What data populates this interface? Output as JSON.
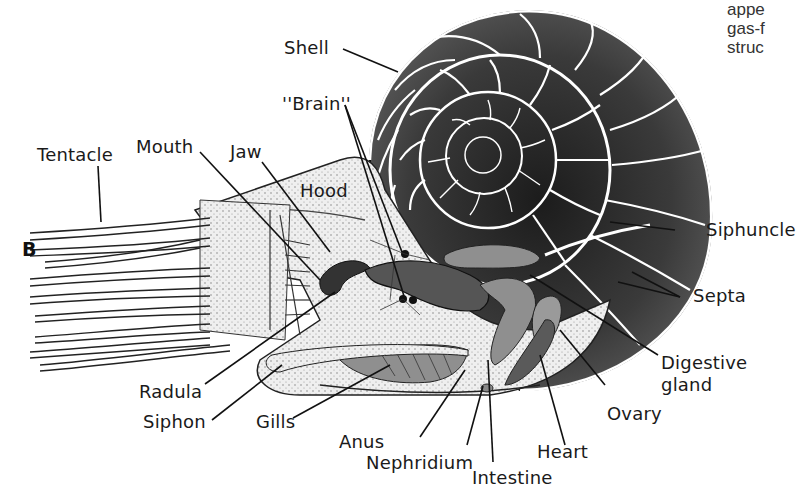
{
  "figure": {
    "panel_letter": "B",
    "caption_fragment": [
      "appe",
      "gas-f",
      "struc"
    ],
    "colors": {
      "ink": "#1a1a1a",
      "shell_fill": "#3a3a3a",
      "organ_fill": "#8f8f8f",
      "body_fill": "#e6e6e6",
      "background": "#ffffff"
    }
  },
  "labels": {
    "shell": "Shell",
    "brain": "''Brain''",
    "tentacle": "Tentacle",
    "mouth": "Mouth",
    "jaw": "Jaw",
    "hood": "Hood",
    "siphuncle": "Siphuncle",
    "septa": "Septa",
    "digestive_gland_line1": "Digestive",
    "digestive_gland_line2": "gland",
    "ovary": "Ovary",
    "heart": "Heart",
    "intestine": "Intestine",
    "nephridium": "Nephridium",
    "anus": "Anus",
    "gills": "Gills",
    "siphon": "Siphon",
    "radula": "Radula"
  }
}
